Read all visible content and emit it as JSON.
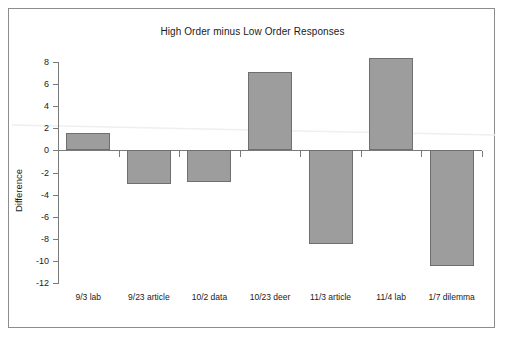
{
  "chart_data": {
    "type": "bar",
    "title": "High Order minus Low Order Responses",
    "xlabel": "",
    "ylabel": "Difference",
    "categories": [
      "9/3 lab",
      "9/23 article",
      "10/2 data",
      "10/23 deer",
      "11/3 article",
      "11/4 lab",
      "1/7 dilemma"
    ],
    "values": [
      1.6,
      -3.0,
      -2.9,
      7.1,
      -8.5,
      8.4,
      -10.5
    ],
    "ylim": [
      -12,
      8
    ],
    "yticks": [
      8,
      6,
      4,
      2,
      0,
      -2,
      -4,
      -6,
      -8,
      -10,
      -12
    ],
    "ytick_labels": [
      "8",
      "6",
      "4",
      "2",
      "0",
      "-2",
      "-4",
      "-6",
      "-8",
      "-10",
      "-12"
    ],
    "grid": false,
    "legend": null,
    "bar_color": "#9d9d9d",
    "bar_edge_color": "#6f6f6f",
    "axis_color": "#7a7a7a",
    "trendline": {
      "visible": true,
      "color": "#efefef",
      "start_value": 2.3,
      "end_value": 1.4
    }
  },
  "figure": {
    "border_color": "#8d8d8d",
    "background": "#ffffff"
  }
}
